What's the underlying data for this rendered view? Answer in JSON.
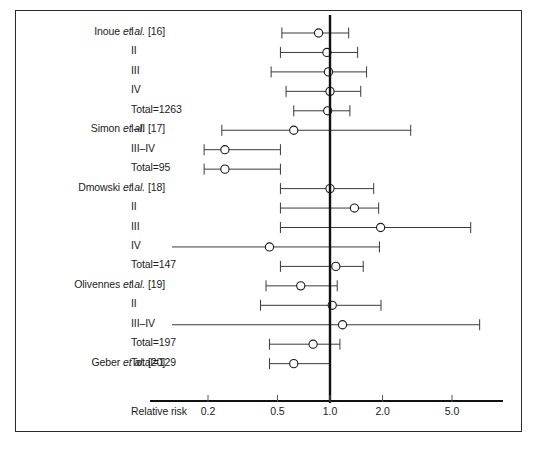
{
  "figure": {
    "axis_title": "Relative risk",
    "tick_labels": [
      "0.2",
      "0.5",
      "1.0",
      "2.0",
      "5.0"
    ],
    "null_line_value": "1.0",
    "marker_style": "open-circle",
    "line_color": "#3a3a3a",
    "null_line_color": "#111111",
    "axis_color": "#111111",
    "frame_color": "#2a2a2a"
  },
  "chart_data": {
    "type": "forest",
    "title": "",
    "xlabel": "Relative risk",
    "ylabel": "",
    "xscale": "log",
    "xlim": [
      0.13,
      9.0
    ],
    "xticks": [
      0.2,
      0.5,
      1.0,
      2.0,
      5.0
    ],
    "xticklabels": [
      "0.2",
      "0.5",
      "1.0",
      "2.0",
      "5.0"
    ],
    "reference_line": 1.0,
    "grid": false,
    "legend": "none",
    "studies": [
      {
        "study": "Inoue et al. [16]",
        "rows": [
          {
            "stage": "I",
            "estimate": 0.86,
            "ci_low": 0.53,
            "ci_high": 1.28,
            "low_clipped": false,
            "high_clipped": false
          },
          {
            "stage": "II",
            "estimate": 0.96,
            "ci_low": 0.52,
            "ci_high": 1.44,
            "low_clipped": false,
            "high_clipped": false
          },
          {
            "stage": "III",
            "estimate": 0.98,
            "ci_low": 0.46,
            "ci_high": 1.62,
            "low_clipped": false,
            "high_clipped": false
          },
          {
            "stage": "IV",
            "estimate": 1.0,
            "ci_low": 0.56,
            "ci_high": 1.5,
            "low_clipped": false,
            "high_clipped": false
          },
          {
            "stage": "Total=1263",
            "estimate": 0.97,
            "ci_low": 0.62,
            "ci_high": 1.3,
            "low_clipped": false,
            "high_clipped": false
          }
        ]
      },
      {
        "study": "Simon et al. [17]",
        "rows": [
          {
            "stage": "I–II",
            "estimate": 0.62,
            "ci_low": 0.24,
            "ci_high": 2.9,
            "low_clipped": false,
            "high_clipped": false
          },
          {
            "stage": "III–IV",
            "estimate": 0.25,
            "ci_low": 0.19,
            "ci_high": 0.52,
            "low_clipped": false,
            "high_clipped": false
          },
          {
            "stage": "Total=95",
            "estimate": 0.25,
            "ci_low": 0.19,
            "ci_high": 0.52,
            "low_clipped": false,
            "high_clipped": false
          }
        ]
      },
      {
        "study": "Dmowski et al. [18]",
        "rows": [
          {
            "stage": "I",
            "estimate": 1.0,
            "ci_low": 0.52,
            "ci_high": 1.78,
            "low_clipped": false,
            "high_clipped": false
          },
          {
            "stage": "II",
            "estimate": 1.38,
            "ci_low": 0.52,
            "ci_high": 1.9,
            "low_clipped": false,
            "high_clipped": false
          },
          {
            "stage": "III",
            "estimate": 1.95,
            "ci_low": 0.52,
            "ci_high": 6.4,
            "low_clipped": false,
            "high_clipped": false
          },
          {
            "stage": "IV",
            "estimate": 0.45,
            "ci_low": 0.13,
            "ci_high": 1.92,
            "low_clipped": true,
            "high_clipped": false
          },
          {
            "stage": "Total=147",
            "estimate": 1.08,
            "ci_low": 0.52,
            "ci_high": 1.55,
            "low_clipped": false,
            "high_clipped": false
          }
        ]
      },
      {
        "study": "Olivennes et al. [19]",
        "rows": [
          {
            "stage": "I",
            "estimate": 0.68,
            "ci_low": 0.43,
            "ci_high": 1.1,
            "low_clipped": false,
            "high_clipped": false
          },
          {
            "stage": "II",
            "estimate": 1.03,
            "ci_low": 0.4,
            "ci_high": 1.96,
            "low_clipped": false,
            "high_clipped": false
          },
          {
            "stage": "III–IV",
            "estimate": 1.18,
            "ci_low": 0.13,
            "ci_high": 7.2,
            "low_clipped": true,
            "high_clipped": false
          },
          {
            "stage": "Total=197",
            "estimate": 0.8,
            "ci_low": 0.45,
            "ci_high": 1.14,
            "low_clipped": false,
            "high_clipped": false
          }
        ]
      },
      {
        "study": "Geber et al. [20]",
        "rows": [
          {
            "stage": "Total=129",
            "estimate": 0.62,
            "ci_low": 0.45,
            "ci_high": 1.0,
            "low_clipped": false,
            "high_clipped": false
          }
        ]
      }
    ]
  }
}
